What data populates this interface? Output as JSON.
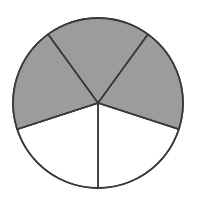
{
  "figure": {
    "background_color": "#ffffff"
  },
  "chart_data": {
    "type": "pie",
    "title": "",
    "subtitle": "",
    "xlabel": "",
    "ylabel": "",
    "legend_position": "none",
    "grid": false,
    "total_slices": 5,
    "shaded_slices": 3,
    "unshaded_slices": 2,
    "fraction_shaded": "3/5",
    "fraction_shaded_decimal": 0.6,
    "slice_angle_degrees": 72,
    "categories": [
      "slice-1",
      "slice-2",
      "slice-3",
      "slice-4",
      "slice-5"
    ],
    "values": [
      20,
      20,
      20,
      20,
      20
    ],
    "labels": [],
    "colors": {
      "shaded": "#9c9c9c",
      "unshaded": "#ffffff",
      "outline": "#3a3a3a"
    },
    "slices": [
      {
        "name": "slice-1",
        "start_angle": 234,
        "end_angle": 306,
        "shaded": true,
        "fill": "#9c9c9c",
        "position": "top"
      },
      {
        "name": "slice-2",
        "start_angle": 306,
        "end_angle": 18,
        "shaded": true,
        "fill": "#9c9c9c",
        "position": "upper-right"
      },
      {
        "name": "slice-3",
        "start_angle": 18,
        "end_angle": 90,
        "shaded": false,
        "fill": "#ffffff",
        "position": "lower-right"
      },
      {
        "name": "slice-4",
        "start_angle": 90,
        "end_angle": 162,
        "shaded": false,
        "fill": "#ffffff",
        "position": "lower-left"
      },
      {
        "name": "slice-5",
        "start_angle": 162,
        "end_angle": 234,
        "shaded": true,
        "fill": "#9c9c9c",
        "position": "upper-left"
      }
    ]
  },
  "geometry": {
    "center_x": 98,
    "center_y": 103,
    "radius": 85,
    "outline_width": 1.8,
    "divider_width": 1.4
  }
}
